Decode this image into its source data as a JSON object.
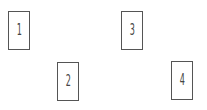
{
  "cards": [
    {
      "label": "1",
      "x": 8,
      "y": 11
    },
    {
      "label": "2",
      "x": 57,
      "y": 62
    },
    {
      "label": "3",
      "x": 121,
      "y": 11
    },
    {
      "label": "4",
      "x": 171,
      "y": 61
    }
  ],
  "colors": {
    "border": "#555555",
    "text": "#444444",
    "background": "#ffffff"
  }
}
